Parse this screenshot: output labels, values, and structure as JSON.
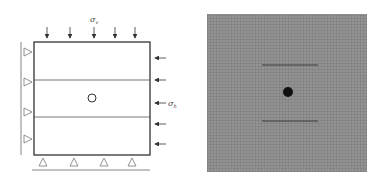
{
  "left_panel": {
    "title": "Boundary conditions and loading",
    "labels": {
      "sigma_v": "σ",
      "sigma_v_sub": "v",
      "sigma_h": "σ",
      "sigma_h_sub": "h"
    },
    "top_arrow_count": 5,
    "right_arrow_count": 5,
    "left_support_count": 4,
    "bottom_support_count": 4,
    "layer_count": 3,
    "hole": "circular opening"
  },
  "right_panel": {
    "title": "Finite element mesh",
    "features": [
      "central opening (filled)",
      "upper horizontal joint",
      "lower horizontal joint"
    ]
  },
  "colors": {
    "line": "#333333",
    "mesh_bg": "#8a8a8a",
    "mesh_line": "#6e6e6e",
    "hole_fill": "#111111"
  }
}
